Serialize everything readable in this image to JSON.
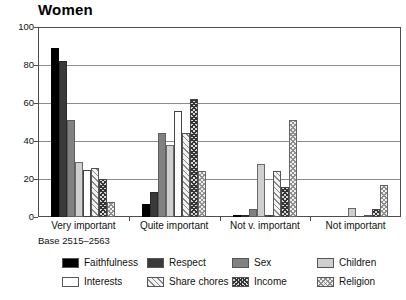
{
  "chart_data": {
    "type": "bar",
    "title": "Women",
    "xlabel": "",
    "ylabel": "",
    "ylim": [
      0,
      100
    ],
    "yticks": [
      0,
      20,
      40,
      60,
      80,
      100
    ],
    "grid": true,
    "legend_position": "bottom",
    "note": "Base 2515–2563",
    "categories": [
      "Very important",
      "Quite important",
      "Not v. important",
      "Not important"
    ],
    "series": [
      {
        "name": "Faithfulness",
        "color": "#000000",
        "pattern": "solid-black",
        "values": [
          89,
          7,
          1,
          0
        ]
      },
      {
        "name": "Respect",
        "color": "#3a3a3a",
        "pattern": "solid-dark",
        "values": [
          82,
          13,
          1,
          0
        ]
      },
      {
        "name": "Sex",
        "color": "#818181",
        "pattern": "solid-mid",
        "values": [
          51,
          44,
          4,
          0
        ]
      },
      {
        "name": "Children",
        "color": "#cfcfcf",
        "pattern": "solid-light",
        "values": [
          29,
          38,
          28,
          5
        ]
      },
      {
        "name": "Interests",
        "color": "#ffffff",
        "pattern": "open-white",
        "values": [
          25,
          56,
          1,
          0
        ]
      },
      {
        "name": "Share chores",
        "color": "#f2f2f2",
        "pattern": "diagonal-hatch",
        "values": [
          26,
          44,
          24,
          1
        ]
      },
      {
        "name": "Income",
        "color": "#d8d8d8",
        "pattern": "dark-crosshatch",
        "values": [
          20,
          62,
          16,
          4
        ]
      },
      {
        "name": "Religion",
        "color": "#efefef",
        "pattern": "light-crosshatch",
        "values": [
          8,
          24,
          51,
          17
        ]
      }
    ]
  },
  "legend": {
    "items": [
      {
        "label": "Faithfulness",
        "swatch": "f-faithfulness"
      },
      {
        "label": "Respect",
        "swatch": "f-respect"
      },
      {
        "label": "Sex",
        "swatch": "f-sex"
      },
      {
        "label": "Children",
        "swatch": "f-children"
      },
      {
        "label": "Interests",
        "swatch": "f-interests"
      },
      {
        "label": "Share chores",
        "swatch": "f-sharechores"
      },
      {
        "label": "Income",
        "swatch": "f-income"
      },
      {
        "label": "Religion",
        "swatch": "f-religion"
      }
    ]
  }
}
